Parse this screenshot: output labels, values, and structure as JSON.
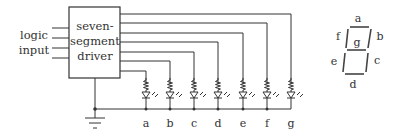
{
  "diagram": {
    "input_label": [
      "logic",
      "input"
    ],
    "driver_label": [
      "seven-",
      "segment",
      "driver"
    ],
    "segments": [
      "a",
      "b",
      "c",
      "d",
      "e",
      "f",
      "g"
    ],
    "display_labels": {
      "a": "a",
      "b": "b",
      "c": "c",
      "d": "d",
      "e": "e",
      "f": "f",
      "g": "g"
    },
    "ground_symbol": "ground-icon",
    "led_symbol": "led-icon",
    "resistor_symbol": "resistor-icon"
  }
}
